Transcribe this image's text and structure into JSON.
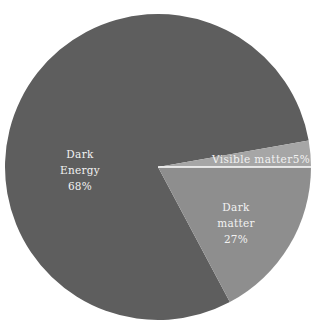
{
  "chart_data": {
    "type": "pie",
    "title": "",
    "categories": [
      "Dark Energy",
      "Dark matter",
      "Visible matter"
    ],
    "values": [
      68,
      27,
      5
    ],
    "unit": "%",
    "labels": [
      {
        "name": "Dark Energy",
        "line1": "Dark",
        "line2": "Energy",
        "pct": "68%"
      },
      {
        "name": "Dark matter",
        "line1": "Dark",
        "line2": "matter",
        "pct": "27%"
      },
      {
        "name": "Visible matter",
        "text": "Visible matter",
        "pct": "5%"
      }
    ],
    "colors": {
      "Dark Energy": "#5e5e5e",
      "Dark matter": "#8e8e8e",
      "Visible matter": "#a6a6a6",
      "separator": "#ffffff"
    },
    "legend": "none (labels inside slices)",
    "geometry": {
      "center_x": 158,
      "center_y": 167,
      "radius": 153,
      "visible_matter_angles_deg": [
        -10,
        0
      ],
      "dark_matter_angles_deg": [
        0,
        62
      ],
      "dark_energy_angles_deg": [
        62,
        350
      ]
    }
  }
}
